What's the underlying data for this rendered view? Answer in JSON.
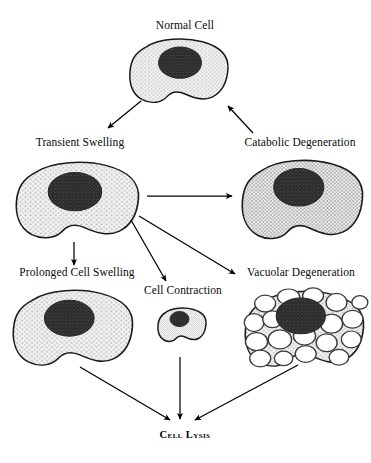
{
  "diagram": {
    "background": "#ffffff",
    "ink": "#000000",
    "cytoplasm_color": "#e8e8e8",
    "nucleus_color": "#3a3a3a",
    "membrane_color": "#1a1a1a"
  },
  "nodes": {
    "normal_cell": {
      "label": "Normal Cell"
    },
    "transient_swelling": {
      "label": "Transient Swelling"
    },
    "catabolic_degeneration": {
      "label": "Catabolic Degeneration"
    },
    "prolonged_cell_swelling": {
      "label": "Prolonged Cell Swelling"
    },
    "cell_contraction": {
      "label": "Cell Contraction"
    },
    "vacuolar_degeneration": {
      "label": "Vacuolar Degeneration"
    },
    "cell_lysis": {
      "label": "Cell Lysis"
    }
  },
  "edges": [
    {
      "from": "normal_cell",
      "to": "transient_swelling"
    },
    {
      "from": "catabolic_degeneration",
      "to": "normal_cell"
    },
    {
      "from": "transient_swelling",
      "to": "catabolic_degeneration"
    },
    {
      "from": "transient_swelling",
      "to": "prolonged_cell_swelling"
    },
    {
      "from": "transient_swelling",
      "to": "cell_contraction"
    },
    {
      "from": "transient_swelling",
      "to": "vacuolar_degeneration"
    },
    {
      "from": "prolonged_cell_swelling",
      "to": "cell_lysis"
    },
    {
      "from": "cell_contraction",
      "to": "cell_lysis"
    },
    {
      "from": "vacuolar_degeneration",
      "to": "cell_lysis"
    }
  ],
  "vacuole_count": 18
}
